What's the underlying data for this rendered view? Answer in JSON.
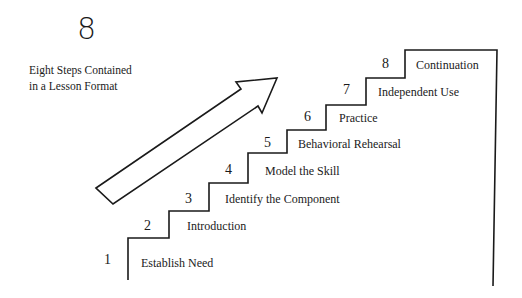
{
  "header": {
    "big_number": "8",
    "caption_line1": "Eight Steps Contained",
    "caption_line2": "in a Lesson Format"
  },
  "steps": [
    {
      "number": "1",
      "label": "Establish Need"
    },
    {
      "number": "2",
      "label": "Introduction"
    },
    {
      "number": "3",
      "label": "Identify the Component"
    },
    {
      "number": "4",
      "label": "Model the Skill"
    },
    {
      "number": "5",
      "label": "Behavioral Rehearsal"
    },
    {
      "number": "6",
      "label": "Practice"
    },
    {
      "number": "7",
      "label": "Independent Use"
    },
    {
      "number": "8",
      "label": "Continuation"
    }
  ],
  "graphics": {
    "arrow": "up-right-arrow",
    "staircase": "ascending-steps",
    "line_color": "#1a1a1a"
  }
}
